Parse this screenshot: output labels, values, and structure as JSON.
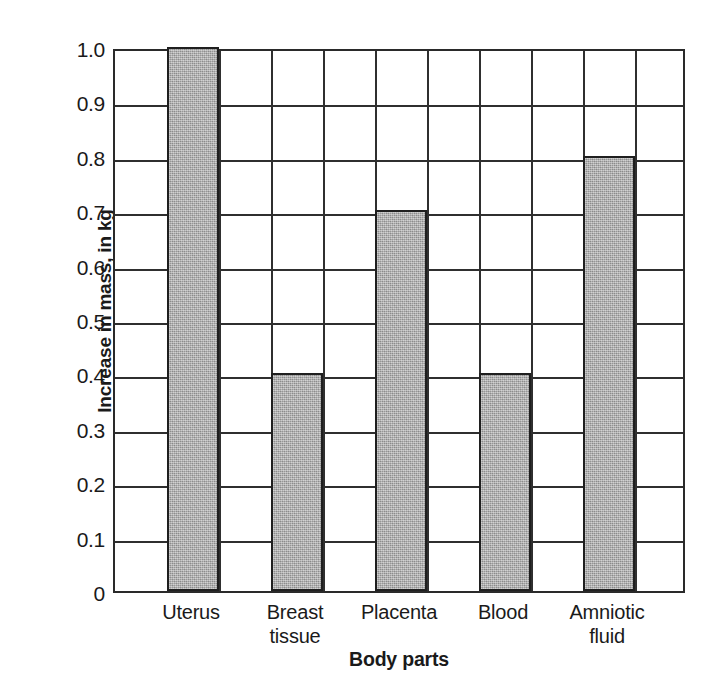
{
  "chart_data": {
    "type": "bar",
    "title": "",
    "xlabel": "Body parts",
    "ylabel": "Increase in mass, in kg",
    "categories": [
      "Uterus",
      "Breast tissue",
      "Placenta",
      "Blood",
      "Amniotic fluid"
    ],
    "category_display": [
      "Uterus",
      "Breast\ntissue",
      "Placenta",
      "Blood",
      "Amniotic\nfluid"
    ],
    "values": [
      1.0,
      0.4,
      0.7,
      0.4,
      0.8
    ],
    "ylim": [
      0,
      1.0
    ],
    "ytick_labels": [
      "0",
      "0.1",
      "0.2",
      "0.3",
      "0.4",
      "0.5",
      "0.6",
      "0.7",
      "0.8",
      "0.9",
      "1.0"
    ],
    "ytick_values": [
      0,
      0.1,
      0.2,
      0.3,
      0.4,
      0.5,
      0.6,
      0.7,
      0.8,
      0.9,
      1.0
    ],
    "grid": true,
    "grid_columns": 11,
    "grid_rows": 10,
    "legend": "none",
    "bar_color": "#a9a9a9",
    "bar_edge_color": "#1f1f1f",
    "axis_color": "#2a2a2a",
    "background_color": "#ffffff"
  }
}
